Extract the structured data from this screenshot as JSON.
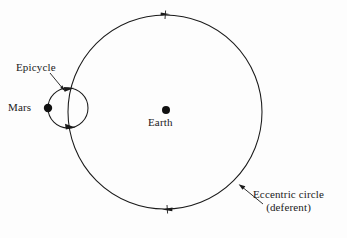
{
  "diagram": {
    "background_color": "#fdfdfd",
    "stroke_color": "#1a1a1a",
    "labels": {
      "epicycle": "Epicycle",
      "mars": "Mars",
      "earth": "Earth",
      "deferent_line1": "Eccentric circle",
      "deferent_line2": "(deferent)"
    },
    "geometry": {
      "deferent": {
        "cx": 165,
        "cy": 112,
        "r": 97
      },
      "epicycle": {
        "cx": 68,
        "cy": 108,
        "r": 20
      },
      "mars_point": {
        "cx": 48,
        "cy": 108,
        "r": 4.2
      },
      "earth_point": {
        "cx": 166,
        "cy": 110,
        "r": 4.0
      }
    },
    "direction_markers": [
      {
        "name": "deferent-top-marker",
        "x": 166,
        "y": 15
      },
      {
        "name": "deferent-bottom-marker",
        "x": 167,
        "y": 209
      },
      {
        "name": "epicycle-top-marker",
        "x": 70,
        "y": 89
      },
      {
        "name": "epicycle-bottom-marker",
        "x": 71,
        "y": 127
      }
    ],
    "leader_lines": [
      {
        "name": "epicycle-leader",
        "x1": 50,
        "y1": 73,
        "x2": 64,
        "y2": 90
      },
      {
        "name": "deferent-leader",
        "x1": 263,
        "y1": 204,
        "x2": 240,
        "y2": 185
      }
    ]
  }
}
